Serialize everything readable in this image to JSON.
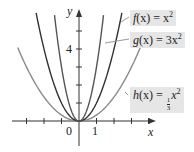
{
  "chart_data": {
    "type": "line",
    "title": "",
    "xlabel": "x",
    "ylabel": "y",
    "xlim": [
      -4,
      4.3
    ],
    "ylim": [
      -1.3,
      6.2
    ],
    "x_tick_labels": [
      "0",
      "1"
    ],
    "y_tick_labels": [
      "4"
    ],
    "x_ticks": [
      -3,
      -2,
      -1,
      0,
      1,
      2,
      3,
      4
    ],
    "y_ticks": [
      1,
      2,
      3,
      4,
      5
    ],
    "grid": false,
    "series": [
      {
        "name": "f(x) = x^2",
        "function": "x^2",
        "coef": 1,
        "color": "#333333",
        "x_range": [
          -2.45,
          2.45
        ]
      },
      {
        "name": "g(x) = 3x^2",
        "function": "3x^2",
        "coef": 3,
        "color": "#555555",
        "x_range": [
          -1.4,
          1.4
        ]
      },
      {
        "name": "h(x) = (1/3)x^2",
        "function": "(1/3)x^2",
        "coef": 0.3333,
        "color": "#8a8a8a",
        "x_range": [
          -3.5,
          3.5
        ]
      }
    ],
    "legend": {
      "position": "right",
      "style": "inline boxed labels"
    }
  },
  "labels": {
    "f": {
      "name": "f",
      "arg": "(x) = x",
      "exp": "2"
    },
    "g": {
      "name": "g",
      "arg": "(x) = 3x",
      "exp": "2"
    },
    "h": {
      "name": "h",
      "arg": "(x) = ",
      "num": "1",
      "den": "3",
      "var": "x",
      "exp": "2"
    },
    "x_axis": "x",
    "y_axis": "y",
    "origin": "0",
    "x_one": "1",
    "y_four": "4"
  }
}
